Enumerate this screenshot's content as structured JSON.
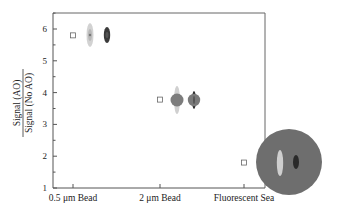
{
  "chart_data": {
    "type": "scatter",
    "title": "",
    "xlabel": "",
    "ylabel": {
      "numerator": "Signal (AO)",
      "denominator": "Signal (No AO)"
    },
    "categories": [
      "0.5 μm Bead",
      "2 μm Bead",
      "Fluorescent Sea"
    ],
    "ylim": [
      1,
      6.5
    ],
    "yticks": [
      "1",
      "2",
      "3",
      "4",
      "5",
      "6"
    ],
    "grid": false,
    "legend": "none",
    "series": [
      {
        "name": "Signal ratio",
        "marker": "open-square",
        "values": [
          5.8,
          3.78,
          1.8
        ]
      }
    ],
    "annotations": [
      {
        "category": "0.5 μm Bead",
        "type": "PSF thumbnails",
        "description": "light gray elongated spot and dark elongated spot"
      },
      {
        "category": "2 μm Bead",
        "type": "bead thumbnails",
        "description": "gray disc with light axial streak and gray disc with dark axial streak"
      },
      {
        "category": "Fluorescent Sea",
        "type": "sea thumbnail",
        "description": "large gray disc containing light and dark elongated spots"
      }
    ]
  },
  "colors": {
    "axis": "#555555",
    "marker": "#666666",
    "glyph_light": "#c8c8c8",
    "glyph_mid": "#7a7a7a",
    "glyph_dark": "#3a3a3a",
    "sea_disc": "#6e6e6e"
  }
}
